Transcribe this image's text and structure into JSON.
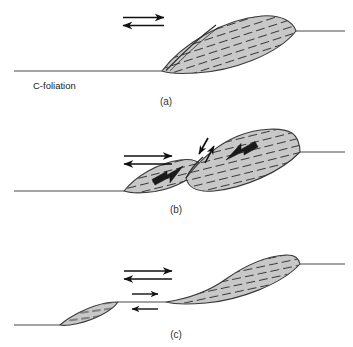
{
  "figure": {
    "background_color": "#ffffff",
    "line_color": "#4a4a4a",
    "lens_fill": "#c8c8c8",
    "lens_stroke": "#3a3a3a",
    "foliation_color": "#3a3a3a",
    "arrow_color": "#111111",
    "thick_arrow_color": "#1a1a1a"
  },
  "annotations": {
    "c_foliation_label": "C-foliation"
  },
  "panels": [
    {
      "id": "a",
      "label": "(a)",
      "description": "Intact sigmoidal lens on C-foliation with incipient curved fracture",
      "shear_couple": {
        "top_arrow_direction": "right",
        "bottom_arrow_direction": "left",
        "sense": "dextral"
      },
      "lenses": 1,
      "fracture": "incipient"
    },
    {
      "id": "b",
      "label": "(b)",
      "description": "Lens breaking along antithetic fracture, two blocks displacing",
      "shear_couple": {
        "top_arrow_direction": "right",
        "bottom_arrow_direction": "left",
        "sense": "dextral"
      },
      "lenses": 2,
      "fracture": "active",
      "block_arrows": [
        {
          "name": "left-block-arrow",
          "direction": "down-left"
        },
        {
          "name": "right-block-arrow",
          "direction": "up-right"
        }
      ],
      "slip_arrows": [
        {
          "name": "fracture-slip-arrow-down",
          "direction": "down-left"
        },
        {
          "name": "fracture-slip-arrow-up",
          "direction": "up-right"
        }
      ]
    },
    {
      "id": "c",
      "label": "(c)",
      "description": "Fully separated lenses linked by new C-foliation segment",
      "shear_couple": {
        "top_arrow_direction": "right",
        "bottom_arrow_direction": "left",
        "sense": "dextral"
      },
      "secondary_shear_couple": {
        "top_arrow_direction": "right",
        "bottom_arrow_direction": "left",
        "sense": "dextral"
      },
      "lenses": 2,
      "fracture": "separated"
    }
  ]
}
